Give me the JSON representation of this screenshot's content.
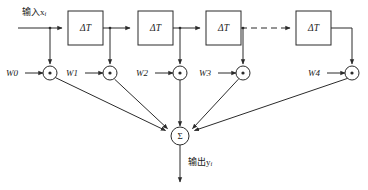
{
  "diagram": {
    "input_label": {
      "text": "输入x",
      "subscript": "i",
      "full": "输入xi"
    },
    "output_label": {
      "text": "输出y",
      "subscript": "i",
      "full": "输出yi"
    },
    "delay_label": "ΔT",
    "sum_label": "Σ",
    "multiplier_symbol": "×",
    "delay_blocks": [
      {
        "id": "delay-1",
        "label": "ΔT"
      },
      {
        "id": "delay-2",
        "label": "ΔT"
      },
      {
        "id": "delay-3",
        "label": "ΔT"
      },
      {
        "id": "delay-4",
        "label": "ΔT"
      }
    ],
    "weights": [
      {
        "id": "w0",
        "label": "W0"
      },
      {
        "id": "w1",
        "label": "W1"
      },
      {
        "id": "w2",
        "label": "W2"
      },
      {
        "id": "w3",
        "label": "W3"
      },
      {
        "id": "w4",
        "label": "W4"
      }
    ],
    "colors": {
      "stroke": "#2b2b2b",
      "text": "#1a1a1a",
      "background": "#ffffff"
    },
    "connector_style": {
      "main_line": "solid",
      "elision": "dashed"
    }
  }
}
